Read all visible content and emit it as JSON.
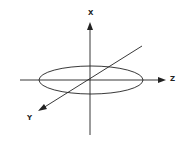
{
  "diagram": {
    "type": "3d-coordinate-axes",
    "axes": [
      {
        "name": "x",
        "label": "X",
        "direction": "up"
      },
      {
        "name": "z",
        "label": "Z",
        "direction": "right"
      },
      {
        "name": "y",
        "label": "Y",
        "direction": "down-left"
      }
    ],
    "shapes": [
      {
        "type": "ellipse",
        "plane": "horizontal",
        "centered_at": "origin"
      }
    ],
    "colors": {
      "stroke": "#222222",
      "background": "#ffffff"
    }
  }
}
